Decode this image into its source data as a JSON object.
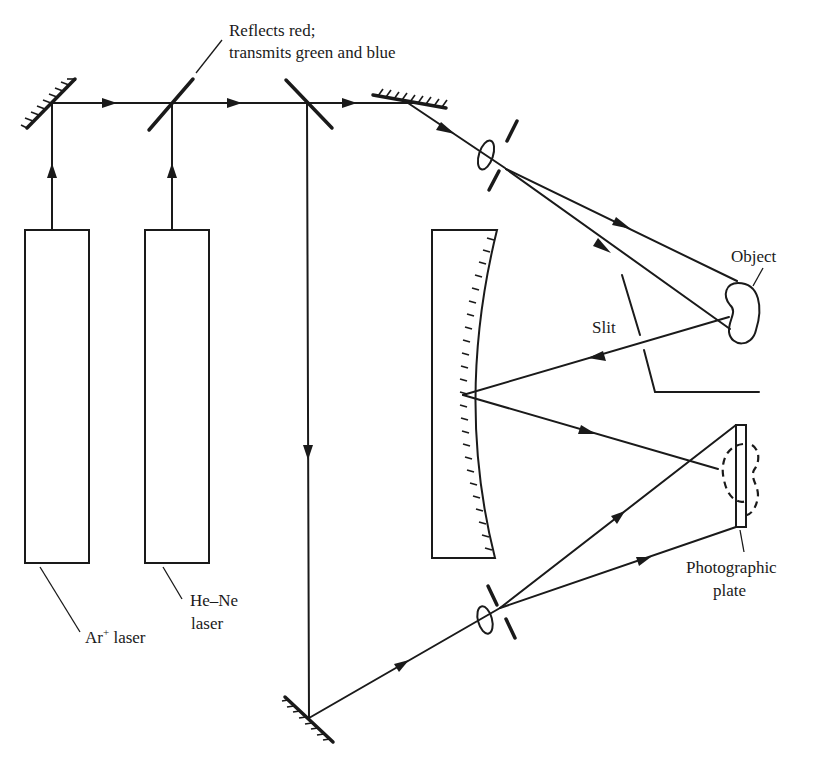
{
  "figure": {
    "type": "optical setup diagram"
  },
  "labels": {
    "beamsplitter_note_line1": "Reflects red;",
    "beamsplitter_note_line2": "transmits green and blue",
    "object": "Object",
    "slit": "Slit",
    "plate_line1": "Photographic",
    "plate_line2": "plate",
    "ar_laser_main": "Ar",
    "ar_laser_sup": "+",
    "ar_laser_suffix": " laser",
    "hene_line1": "He–Ne",
    "hene_line2": "laser"
  },
  "components": [
    {
      "name": "Ar+ laser",
      "kind": "laser"
    },
    {
      "name": "He-Ne laser",
      "kind": "laser"
    },
    {
      "name": "turning mirror (top-left)",
      "kind": "mirror"
    },
    {
      "name": "dichroic beamsplitter",
      "kind": "beamsplitter"
    },
    {
      "name": "beamsplitter",
      "kind": "beamsplitter"
    },
    {
      "name": "turning mirror (top-right)",
      "kind": "mirror"
    },
    {
      "name": "object beam lens + pinhole",
      "kind": "spatial filter"
    },
    {
      "name": "object",
      "kind": "object"
    },
    {
      "name": "slit",
      "kind": "aperture"
    },
    {
      "name": "concave mirror",
      "kind": "mirror"
    },
    {
      "name": "photographic plate",
      "kind": "detector"
    },
    {
      "name": "reference beam lens + pinhole",
      "kind": "spatial filter"
    },
    {
      "name": "turning mirror (bottom)",
      "kind": "mirror"
    }
  ]
}
